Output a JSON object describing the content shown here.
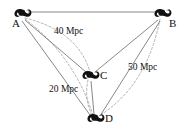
{
  "figure": {
    "kind": "galaxy-separation-diagram",
    "width": 187,
    "height": 135,
    "background_color": "#ffffff",
    "line_color": "#555555",
    "dashed_color": "#9a9a9a",
    "glyph_color": "#111111",
    "text_color": "#111111"
  },
  "nodes": [
    {
      "id": "A",
      "label": "A",
      "icon": "spiral-galaxy-icon",
      "x": 22,
      "y": 14,
      "label_x": 12,
      "label_y": 21
    },
    {
      "id": "B",
      "label": "B",
      "icon": "spiral-galaxy-icon",
      "x": 162,
      "y": 14,
      "label_x": 168,
      "label_y": 21
    },
    {
      "id": "C",
      "label": "C",
      "icon": "spiral-galaxy-icon",
      "x": 90,
      "y": 76,
      "label_x": 99,
      "label_y": 72
    },
    {
      "id": "D",
      "label": "D",
      "icon": "spiral-galaxy-icon",
      "x": 95,
      "y": 119,
      "label_x": 104,
      "label_y": 115
    }
  ],
  "solid_edges": [
    {
      "from": "A",
      "to": "B"
    },
    {
      "from": "A",
      "to": "C"
    },
    {
      "from": "A",
      "to": "D"
    },
    {
      "from": "B",
      "to": "C"
    },
    {
      "from": "B",
      "to": "D"
    },
    {
      "from": "C",
      "to": "D"
    }
  ],
  "dashed_edges": [
    {
      "from": "A",
      "to": "C",
      "measure": "40 Mpc"
    },
    {
      "from": "A",
      "to": "D",
      "measure": ""
    },
    {
      "from": "B",
      "to": "D",
      "measure": "50 Mpc"
    },
    {
      "from": "C",
      "to": "D",
      "measure": "20 Mpc"
    }
  ],
  "distance_labels": [
    {
      "id": "ac",
      "text": "40 Mpc",
      "x": 55,
      "y": 29
    },
    {
      "id": "bd",
      "text": "50 Mpc",
      "x": 128,
      "y": 64
    },
    {
      "id": "cd",
      "text": "20 Mpc",
      "x": 50,
      "y": 86
    }
  ]
}
